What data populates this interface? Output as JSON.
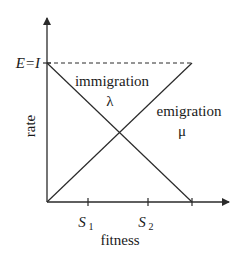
{
  "diagram": {
    "type": "migration-rate-model",
    "axes": {
      "x_label": "fitness",
      "y_label": "rate",
      "y_level_label": "E=I",
      "x_ticks": [
        {
          "label": "S",
          "subscript": "1"
        },
        {
          "label": "S",
          "subscript": "2"
        }
      ]
    },
    "curves": [
      {
        "name": "immigration",
        "symbol": "λ",
        "direction": "decreasing"
      },
      {
        "name": "emigration",
        "symbol": "μ",
        "direction": "increasing"
      }
    ],
    "colors": {
      "line": "#2a2a2a",
      "background": "#ffffff"
    }
  }
}
